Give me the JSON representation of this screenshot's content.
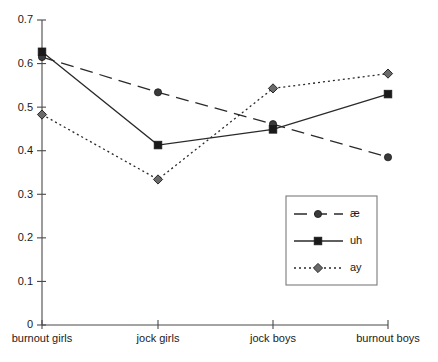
{
  "chart_data": {
    "type": "line",
    "title": "",
    "xlabel": "",
    "ylabel": "",
    "categories": [
      "burnout girls",
      "jock girls",
      "jock boys",
      "burnout boys"
    ],
    "ylim": [
      0,
      0.7
    ],
    "y_ticks": [
      "0",
      "0.1",
      "0.2",
      "0.3",
      "0.4",
      "0.5",
      "0.6",
      "0.7"
    ],
    "y_tick_values": [
      0,
      0.1,
      0.2,
      0.3,
      0.4,
      0.5,
      0.6,
      0.7
    ],
    "grid": false,
    "legend_position": "center-right",
    "series": [
      {
        "name": "æ",
        "values": [
          0.615,
          0.534,
          0.461,
          0.385
        ],
        "line_style": "dashed",
        "marker": "circle",
        "color": "#3a3a3a"
      },
      {
        "name": "uh",
        "values": [
          0.627,
          0.413,
          0.449,
          0.53
        ],
        "line_style": "solid",
        "marker": "square",
        "color": "#1a1a1a"
      },
      {
        "name": "ay",
        "values": [
          0.483,
          0.334,
          0.543,
          0.577
        ],
        "line_style": "dotted",
        "marker": "diamond",
        "color": "#6a6a6a"
      }
    ]
  },
  "legend": {
    "items": [
      {
        "label": "æ"
      },
      {
        "label": "uh"
      },
      {
        "label": "ay"
      }
    ]
  },
  "axes": {
    "y_tick_labels": [
      "0.7",
      "0.6",
      "0.5",
      "0.4",
      "0.3",
      "0.2",
      "0.1",
      "0"
    ],
    "x_tick_labels": [
      "burnout girls",
      "jock girls",
      "jock boys",
      "burnout boys"
    ]
  },
  "caption": {
    "text": ""
  },
  "colors": {
    "axis": "#4a4a4a",
    "text": "#1a1a1a",
    "legend_border": "#7a7a7a",
    "background": "#ffffff"
  }
}
